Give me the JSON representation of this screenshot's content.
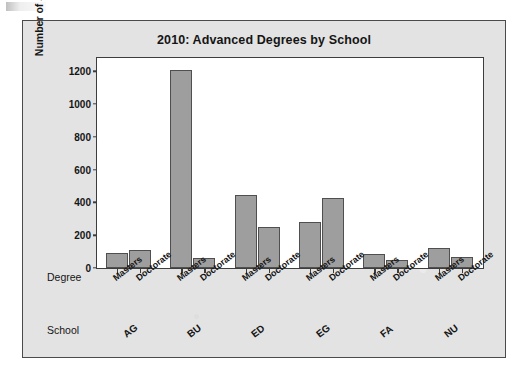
{
  "figure": {
    "background_color": "#e3e3e3",
    "plot_background_color": "#ffffff",
    "bar_fill_color": "#9e9e9e",
    "bar_border_color": "#4f4f4f",
    "axis_color": "#3d3d3d"
  },
  "axis_row_titles": {
    "degree": "Degree",
    "school": "School"
  },
  "chart_data": {
    "type": "bar",
    "title": "2010: Advanced Degrees by School",
    "xlabel": "",
    "ylabel": "Number of Students",
    "ylim": [
      0,
      1280
    ],
    "yticks": [
      0,
      200,
      400,
      600,
      800,
      1000,
      1200
    ],
    "ytick_labels": [
      "0",
      "200",
      "400",
      "600",
      "800",
      "1000",
      "1200"
    ],
    "grid": false,
    "legend": false,
    "grouping": "clustered by school, two degree levels per school",
    "categories": [
      "AG",
      "BU",
      "ED",
      "EG",
      "FA",
      "NU"
    ],
    "subcategories": [
      "Masters",
      "Doctorate"
    ],
    "series": [
      {
        "name": "Masters",
        "values": [
          90,
          1205,
          445,
          280,
          88,
          120
        ]
      },
      {
        "name": "Doctorate",
        "values": [
          108,
          60,
          250,
          425,
          50,
          65
        ]
      }
    ],
    "groups": [
      {
        "school": "AG",
        "bars": [
          {
            "degree": "Masters",
            "value": 90
          },
          {
            "degree": "Doctorate",
            "value": 108
          }
        ]
      },
      {
        "school": "BU",
        "bars": [
          {
            "degree": "Masters",
            "value": 1205
          },
          {
            "degree": "Doctorate",
            "value": 60
          }
        ]
      },
      {
        "school": "ED",
        "bars": [
          {
            "degree": "Masters",
            "value": 445
          },
          {
            "degree": "Doctorate",
            "value": 250
          }
        ]
      },
      {
        "school": "EG",
        "bars": [
          {
            "degree": "Masters",
            "value": 280
          },
          {
            "degree": "Doctorate",
            "value": 425
          }
        ]
      },
      {
        "school": "FA",
        "bars": [
          {
            "degree": "Masters",
            "value": 88
          },
          {
            "degree": "Doctorate",
            "value": 50
          }
        ]
      },
      {
        "school": "NU",
        "bars": [
          {
            "degree": "Masters",
            "value": 120
          },
          {
            "degree": "Doctorate",
            "value": 65
          }
        ]
      }
    ]
  }
}
